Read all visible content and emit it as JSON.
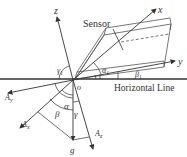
{
  "diagram": {
    "labels": {
      "sensor": "Sensor",
      "horizontal_line": "Horizontal Line",
      "axis_x": "x",
      "axis_y": "y",
      "axis_z": "z",
      "origin": "o",
      "gravity": "g",
      "Ay": "A",
      "Ay_sub": "y",
      "Ax": "A",
      "Ax_sub": "x",
      "Az": "A",
      "Az_sub": "z",
      "alpha": "α",
      "beta": "β",
      "gamma": "γ",
      "alpha1": "α",
      "alpha1_sub": "1",
      "beta1": "β",
      "beta1_sub": "1",
      "gamma1": "γ",
      "gamma1_sub": "1"
    },
    "colors": {
      "line": "#333333",
      "background": "#ffffff"
    }
  }
}
